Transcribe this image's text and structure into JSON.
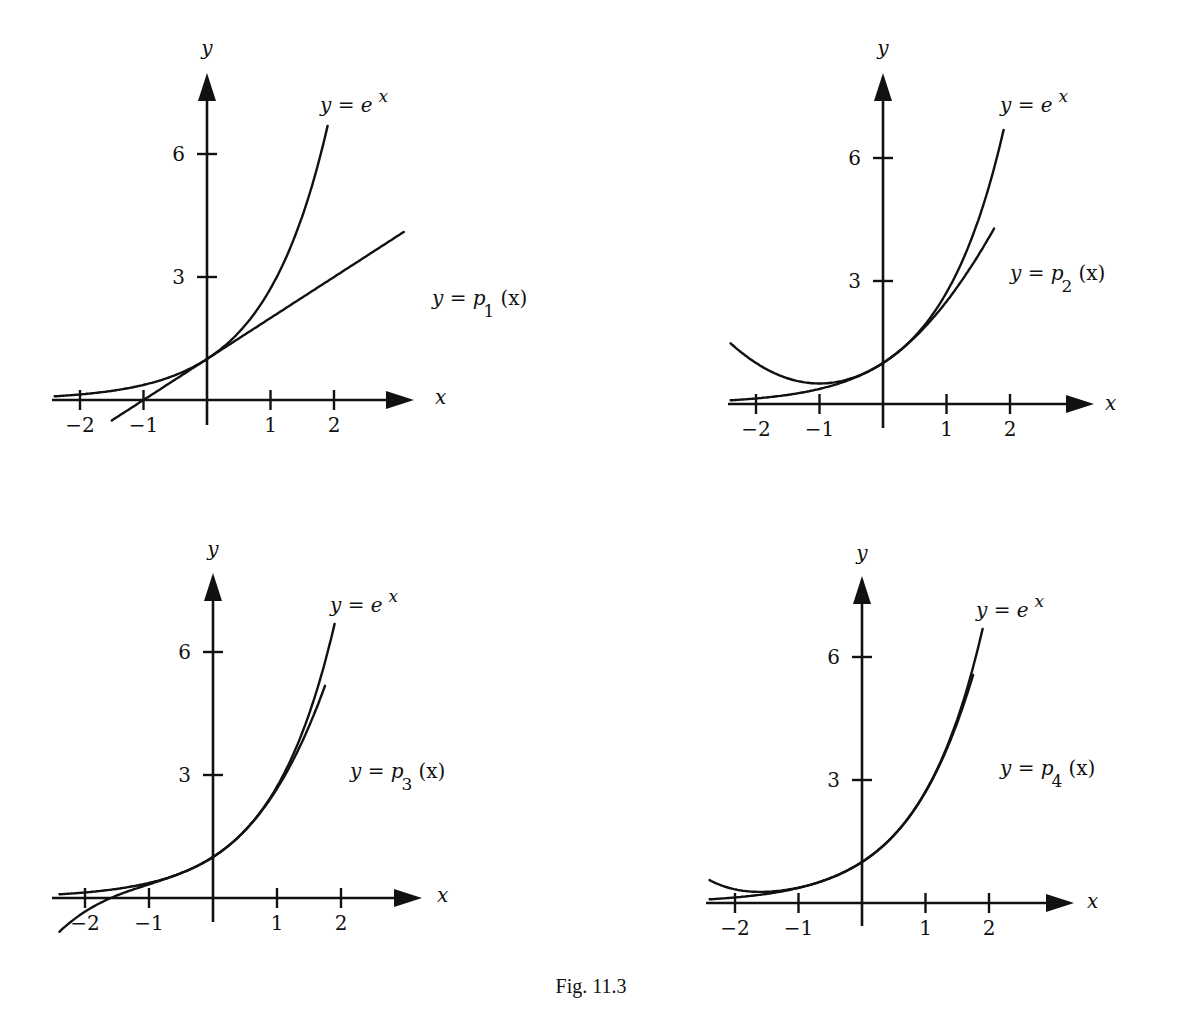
{
  "caption": "Fig. 11.3",
  "chart_data": [
    {
      "type": "line",
      "title": "",
      "xlabel": "x",
      "ylabel": "y",
      "x_ticks": [
        -2,
        -1,
        1,
        2
      ],
      "y_ticks": [
        3,
        6
      ],
      "xlim": [
        -2.4,
        3.1
      ],
      "ylim": [
        -0.5,
        7.8
      ],
      "grid": false,
      "series": [
        {
          "name": "y = e^x",
          "label": "y = e",
          "label_sup": "x",
          "x_range": [
            -2.4,
            1.9
          ],
          "formula": "exp(x)"
        },
        {
          "name": "y = p_1(x)",
          "label": "y = p",
          "label_sub": "1",
          "label_tail": "(x)",
          "x_range": [
            -1.5,
            3.1
          ],
          "formula": "1 + x"
        }
      ]
    },
    {
      "type": "line",
      "title": "",
      "xlabel": "x",
      "ylabel": "y",
      "x_ticks": [
        -2,
        -1,
        1,
        2
      ],
      "y_ticks": [
        3,
        6
      ],
      "xlim": [
        -2.4,
        3.1
      ],
      "ylim": [
        -0.5,
        7.8
      ],
      "grid": false,
      "series": [
        {
          "name": "y = e^x",
          "label": "y = e",
          "label_sup": "x",
          "x_range": [
            -2.4,
            1.9
          ],
          "formula": "exp(x)"
        },
        {
          "name": "y = p_2(x)",
          "label": "y = p",
          "label_sub": "2",
          "label_tail": "(x)",
          "x_range": [
            -2.4,
            1.75
          ],
          "formula": "1 + x + x^2/2"
        }
      ]
    },
    {
      "type": "line",
      "title": "",
      "xlabel": "x",
      "ylabel": "y",
      "x_ticks": [
        -2,
        -1,
        1,
        2
      ],
      "y_ticks": [
        3,
        6
      ],
      "xlim": [
        -2.4,
        3.1
      ],
      "ylim": [
        -0.5,
        7.8
      ],
      "grid": false,
      "series": [
        {
          "name": "y = e^x",
          "label": "y = e",
          "label_sup": "x",
          "x_range": [
            -2.4,
            1.9
          ],
          "formula": "exp(x)"
        },
        {
          "name": "y = p_3(x)",
          "label": "y = p",
          "label_sub": "3",
          "label_tail": "(x)",
          "x_range": [
            -2.4,
            1.75
          ],
          "formula": "1 + x + x^2/2 + x^3/6"
        }
      ]
    },
    {
      "type": "line",
      "title": "",
      "xlabel": "x",
      "ylabel": "y",
      "x_ticks": [
        -2,
        -1,
        1,
        2
      ],
      "y_ticks": [
        3,
        6
      ],
      "xlim": [
        -2.4,
        3.1
      ],
      "ylim": [
        -0.5,
        7.8
      ],
      "grid": false,
      "series": [
        {
          "name": "y = e^x",
          "label": "y = e",
          "label_sup": "x",
          "x_range": [
            -2.4,
            1.9
          ],
          "formula": "exp(x)"
        },
        {
          "name": "y = p_4(x)",
          "label": "y = p",
          "label_sub": "4",
          "label_tail": "(x)",
          "x_range": [
            -2.4,
            1.75
          ],
          "formula": "1 + x + x^2/2 + x^3/6 + x^4/24"
        }
      ]
    }
  ],
  "panels": [
    {
      "ox": 207,
      "oy": 400,
      "ux": 63.5,
      "uy": 41,
      "xl": 52,
      "xr": 412,
      "yt": 75,
      "yb": 425,
      "ylabel_pos": [
        207,
        55
      ],
      "xlabel_pos": [
        435,
        404
      ],
      "exp_label_pos": [
        320,
        112
      ],
      "p_label_pos": [
        432,
        305
      ]
    },
    {
      "ox": 883,
      "oy": 404,
      "ux": 63.5,
      "uy": 41,
      "xl": 728,
      "xr": 1092,
      "yt": 75,
      "yb": 428,
      "ylabel_pos": [
        883,
        55
      ],
      "xlabel_pos": [
        1105,
        410
      ],
      "exp_label_pos": [
        1000,
        112
      ],
      "p_label_pos": [
        1010,
        280
      ]
    },
    {
      "ox": 213,
      "oy": 898,
      "ux": 64,
      "uy": 41,
      "xl": 52,
      "xr": 420,
      "yt": 575,
      "yb": 922,
      "ylabel_pos": [
        213,
        556
      ],
      "xlabel_pos": [
        437,
        902
      ],
      "exp_label_pos": [
        330,
        612
      ],
      "p_label_pos": [
        350,
        778
      ]
    },
    {
      "ox": 862,
      "oy": 903,
      "ux": 63.5,
      "uy": 41,
      "xl": 706,
      "xr": 1072,
      "yt": 578,
      "yb": 926,
      "ylabel_pos": [
        862,
        560
      ],
      "xlabel_pos": [
        1087,
        908
      ],
      "exp_label_pos": [
        976,
        617
      ],
      "p_label_pos": [
        1000,
        775
      ]
    }
  ]
}
